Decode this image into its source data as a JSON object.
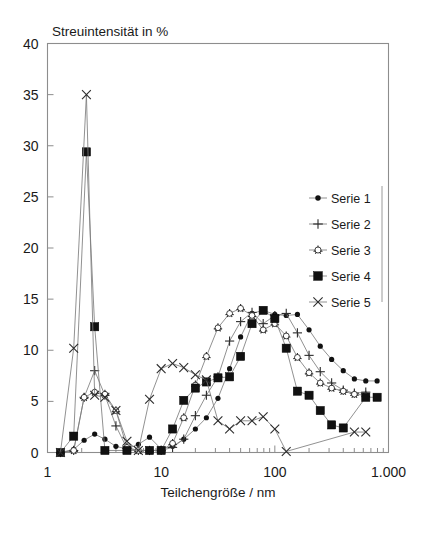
{
  "chart_data": {
    "type": "line",
    "title": "Streuintensität in %",
    "xlabel": "Teilchengröße / nm",
    "ylabel": "Streuintensität in %",
    "xscale": "log",
    "xlim": [
      1,
      1000
    ],
    "ylim": [
      0,
      40
    ],
    "yticks": [
      0,
      5,
      10,
      15,
      20,
      25,
      30,
      35,
      40
    ],
    "ytick_labels": [
      "0",
      "5",
      "10",
      "15",
      "20",
      "25",
      "30",
      "35",
      "40"
    ],
    "xticks": [
      1,
      10,
      100,
      1000
    ],
    "xtick_labels": [
      "1",
      "10",
      "100",
      "1.000"
    ],
    "grid": false,
    "legend_position": "right-inside",
    "series": [
      {
        "name": "Serie 1",
        "marker": "filled-circle",
        "points": [
          [
            1.3,
            0.0
          ],
          [
            1.7,
            0.3
          ],
          [
            2.1,
            1.2
          ],
          [
            2.6,
            1.8
          ],
          [
            3.2,
            1.3
          ],
          [
            4.0,
            0.6
          ],
          [
            5.0,
            0.35
          ],
          [
            6.3,
            0.8
          ],
          [
            7.9,
            1.5
          ],
          [
            10.0,
            0.35
          ],
          [
            12.6,
            0.6
          ],
          [
            15.8,
            1.3
          ],
          [
            20.0,
            2.3
          ],
          [
            25.0,
            3.4
          ],
          [
            31.6,
            5.3
          ],
          [
            40.0,
            8.2
          ],
          [
            50.0,
            11.3
          ],
          [
            63.0,
            13.6
          ],
          [
            79.0,
            13.9
          ],
          [
            100.0,
            13.5
          ],
          [
            126.0,
            13.4
          ],
          [
            158.0,
            13.5
          ],
          [
            200.0,
            12.0
          ],
          [
            251.0,
            10.4
          ],
          [
            316.0,
            9.1
          ],
          [
            400.0,
            8.0
          ],
          [
            501.0,
            7.2
          ],
          [
            631.0,
            7.0
          ],
          [
            794.0,
            7.0
          ]
        ]
      },
      {
        "name": "Serie 2",
        "marker": "plus",
        "points": [
          [
            1.3,
            0.0
          ],
          [
            1.7,
            0.2
          ],
          [
            2.1,
            5.4
          ],
          [
            2.6,
            8.0
          ],
          [
            3.2,
            5.6
          ],
          [
            4.0,
            2.6
          ],
          [
            5.0,
            0.4
          ],
          [
            6.3,
            0.2
          ],
          [
            7.9,
            0.2
          ],
          [
            10.0,
            0.2
          ],
          [
            12.6,
            0.5
          ],
          [
            15.8,
            1.3
          ],
          [
            20.0,
            3.6
          ],
          [
            25.0,
            5.6
          ],
          [
            31.6,
            7.4
          ],
          [
            40.0,
            10.9
          ],
          [
            50.0,
            12.8
          ],
          [
            63.0,
            13.7
          ],
          [
            79.0,
            12.6
          ],
          [
            100.0,
            13.4
          ],
          [
            126.0,
            13.6
          ],
          [
            158.0,
            11.7
          ],
          [
            200.0,
            9.5
          ],
          [
            251.0,
            7.9
          ],
          [
            316.0,
            6.8
          ],
          [
            400.0,
            6.1
          ],
          [
            501.0,
            5.8
          ],
          [
            631.0,
            5.9
          ]
        ]
      },
      {
        "name": "Serie 3",
        "marker": "open-circle",
        "points": [
          [
            1.3,
            0.0
          ],
          [
            1.7,
            0.2
          ],
          [
            2.1,
            5.4
          ],
          [
            2.6,
            5.9
          ],
          [
            3.2,
            5.7
          ],
          [
            4.0,
            4.1
          ],
          [
            5.0,
            0.5
          ],
          [
            6.3,
            0.2
          ],
          [
            7.9,
            0.2
          ],
          [
            10.0,
            0.2
          ],
          [
            12.6,
            0.9
          ],
          [
            15.8,
            3.4
          ],
          [
            20.0,
            6.6
          ],
          [
            25.0,
            9.4
          ],
          [
            31.6,
            12.2
          ],
          [
            40.0,
            13.6
          ],
          [
            50.0,
            14.1
          ],
          [
            63.0,
            13.4
          ],
          [
            79.0,
            12.0
          ],
          [
            100.0,
            12.6
          ],
          [
            126.0,
            11.4
          ],
          [
            158.0,
            9.3
          ],
          [
            200.0,
            7.8
          ],
          [
            251.0,
            6.8
          ],
          [
            316.0,
            6.3
          ],
          [
            400.0,
            6.0
          ],
          [
            501.0,
            5.7
          ],
          [
            631.0,
            5.6
          ]
        ]
      },
      {
        "name": "Serie 4",
        "marker": "filled-square",
        "points": [
          [
            1.3,
            0.0
          ],
          [
            1.7,
            1.6
          ],
          [
            2.2,
            29.4
          ],
          [
            2.6,
            12.3
          ],
          [
            3.2,
            0.2
          ],
          [
            5.0,
            0.2
          ],
          [
            7.9,
            0.2
          ],
          [
            10.0,
            0.2
          ],
          [
            12.6,
            2.3
          ],
          [
            15.8,
            5.1
          ],
          [
            20.0,
            6.3
          ],
          [
            25.0,
            6.9
          ],
          [
            31.6,
            7.3
          ],
          [
            40.0,
            7.4
          ],
          [
            50.0,
            9.4
          ],
          [
            63.0,
            12.6
          ],
          [
            79.0,
            13.9
          ],
          [
            100.0,
            13.1
          ],
          [
            126.0,
            10.2
          ],
          [
            158.0,
            6.0
          ],
          [
            200.0,
            5.6
          ],
          [
            251.0,
            4.1
          ],
          [
            316.0,
            2.7
          ],
          [
            400.0,
            2.4
          ],
          [
            631.0,
            5.4
          ],
          [
            794.0,
            5.4
          ]
        ]
      },
      {
        "name": "Serie 5",
        "marker": "cross",
        "points": [
          [
            1.3,
            0.0
          ],
          [
            1.7,
            10.2
          ],
          [
            2.2,
            35.0
          ],
          [
            2.6,
            5.6
          ],
          [
            3.2,
            5.4
          ],
          [
            4.0,
            4.1
          ],
          [
            5.0,
            1.1
          ],
          [
            6.3,
            0.2
          ],
          [
            7.9,
            5.2
          ],
          [
            10.0,
            8.2
          ],
          [
            12.6,
            8.7
          ],
          [
            15.8,
            8.3
          ],
          [
            20.0,
            7.6
          ],
          [
            25.0,
            7.1
          ],
          [
            31.6,
            3.1
          ],
          [
            40.0,
            2.3
          ],
          [
            50.0,
            3.1
          ],
          [
            63.0,
            3.1
          ],
          [
            79.0,
            3.5
          ],
          [
            100.0,
            2.3
          ],
          [
            126.0,
            0.1
          ],
          [
            501.0,
            2.0
          ],
          [
            631.0,
            2.0
          ]
        ]
      }
    ]
  },
  "legend": {
    "items": [
      {
        "label": "Serie 1"
      },
      {
        "label": "Serie 2"
      },
      {
        "label": "Serie 3"
      },
      {
        "label": "Serie 4"
      },
      {
        "label": "Serie 5"
      }
    ]
  }
}
